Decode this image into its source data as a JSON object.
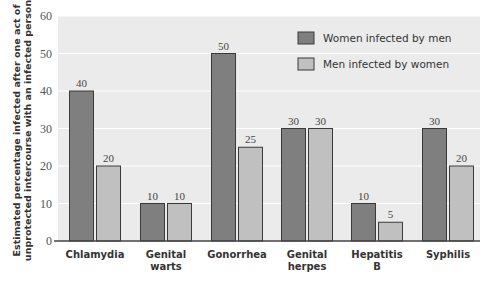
{
  "chart_data": {
    "type": "bar",
    "title": "",
    "xlabel": "",
    "ylabel": "Estimated percentage infected after one act of unprotected intercourse with an infected person",
    "ylabel_lines": [
      "Estimated percentage infected after one act of",
      "unprotected intercourse with an infected person"
    ],
    "ylim": [
      0,
      60
    ],
    "yticks": [
      0,
      10,
      20,
      30,
      40,
      50,
      60
    ],
    "grid": true,
    "legend_position": "upper right",
    "categories": [
      "Chlamydia",
      "Genital warts",
      "Gonorrhea",
      "Genital herpes",
      "Hepatitis B",
      "Syphilis"
    ],
    "category_lines": [
      [
        "Chlamydia"
      ],
      [
        "Genital",
        "warts"
      ],
      [
        "Gonorrhea"
      ],
      [
        "Genital",
        "herpes"
      ],
      [
        "Hepatitis",
        "B"
      ],
      [
        "Syphilis"
      ]
    ],
    "series": [
      {
        "name": "Women infected by men",
        "color": "#7f7f7f",
        "values": [
          40,
          10,
          50,
          30,
          10,
          30
        ]
      },
      {
        "name": "Men infected by women",
        "color": "#c0c0c0",
        "values": [
          20,
          10,
          25,
          30,
          5,
          20
        ]
      }
    ]
  },
  "colors": {
    "plot_background": "#ebebeb",
    "gridline": "#ffffff",
    "bar_outline": "#3a3a3a",
    "axis": "#444444"
  }
}
